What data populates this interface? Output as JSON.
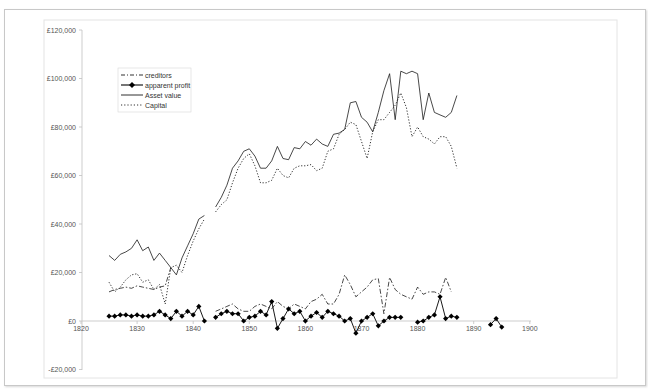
{
  "chart_data": {
    "type": "line",
    "title": "",
    "xlabel": "",
    "ylabel": "",
    "xlim": [
      1820,
      1900
    ],
    "ylim": [
      -20000,
      120000
    ],
    "x_ticks": [
      "1820",
      "1830",
      "1840",
      "1850",
      "1860",
      "1870",
      "1880",
      "1890",
      "1900"
    ],
    "y_ticks": [
      "£120,000",
      "£100,000",
      "£80,000",
      "£60,000",
      "£40,000",
      "£20,000",
      "£0",
      "-£20,000"
    ],
    "grid": false,
    "legend_position": "upper-left (inside plot)",
    "legend": [
      "creditors",
      "apparent profit",
      "Asset value",
      "Capital"
    ],
    "series": [
      {
        "name": "creditors",
        "style": "dash-dot",
        "x": [
          1825,
          1826,
          1827,
          1828,
          1829,
          1830,
          1831,
          1832,
          1833,
          1834,
          1835,
          1836,
          1844,
          1845,
          1846,
          1847,
          1848,
          1849,
          1850,
          1851,
          1852,
          1853,
          1854,
          1855,
          1856,
          1857,
          1858,
          1859,
          1860,
          1861,
          1862,
          1863,
          1864,
          1865,
          1866,
          1867,
          1868,
          1869,
          1870,
          1871,
          1872,
          1873,
          1874,
          1875,
          1876,
          1877,
          1878,
          1879,
          1880,
          1881,
          1882,
          1883,
          1884,
          1885,
          1886
        ],
        "values": [
          12000,
          13000,
          13500,
          14000,
          13500,
          14500,
          14000,
          13500,
          13000,
          14000,
          14500,
          22000,
          4000,
          5000,
          6000,
          7000,
          5000,
          4000,
          4000,
          6000,
          7000,
          6000,
          5000,
          8000,
          6000,
          5000,
          7000,
          6000,
          5000,
          8000,
          9000,
          11000,
          7000,
          7000,
          11000,
          19000,
          15000,
          10000,
          12000,
          14000,
          17000,
          17500,
          3000,
          18000,
          13000,
          11000,
          10000,
          9000,
          14000,
          11000,
          12000,
          12000,
          11000,
          18000,
          12000
        ]
      },
      {
        "name": "apparent profit",
        "style": "solid with diamond markers",
        "x": [
          1825,
          1826,
          1827,
          1828,
          1829,
          1830,
          1831,
          1832,
          1833,
          1834,
          1835,
          1836,
          1837,
          1838,
          1839,
          1840,
          1841,
          1842,
          1844,
          1845,
          1846,
          1847,
          1848,
          1849,
          1850,
          1851,
          1852,
          1853,
          1854,
          1855,
          1856,
          1857,
          1858,
          1859,
          1860,
          1861,
          1862,
          1863,
          1864,
          1865,
          1866,
          1867,
          1868,
          1869,
          1870,
          1871,
          1872,
          1873,
          1874,
          1875,
          1876,
          1877,
          1880,
          1881,
          1882,
          1883,
          1884,
          1885,
          1886,
          1887,
          1893,
          1894,
          1895
        ],
        "values": [
          2000,
          2000,
          2500,
          2500,
          2000,
          2500,
          2000,
          2000,
          2500,
          4000,
          2500,
          1000,
          4000,
          2000,
          4000,
          2500,
          6000,
          0,
          1500,
          3000,
          4000,
          3000,
          3000,
          0,
          1500,
          2000,
          4000,
          2500,
          8000,
          -3000,
          1000,
          5000,
          3000,
          4000,
          0,
          2000,
          3500,
          1500,
          4000,
          3000,
          2000,
          0,
          1000,
          -5000,
          0,
          1500,
          3000,
          -2000,
          0,
          1500,
          1500,
          1500,
          -500,
          0,
          1500,
          2500,
          10000,
          1000,
          2000,
          1500,
          -1500,
          1000,
          -2500
        ]
      },
      {
        "name": "Asset value",
        "style": "solid",
        "x": [
          1825,
          1826,
          1827,
          1828,
          1829,
          1830,
          1831,
          1832,
          1833,
          1834,
          1835,
          1836,
          1837,
          1838,
          1839,
          1840,
          1841,
          1842,
          1844,
          1845,
          1846,
          1847,
          1848,
          1849,
          1850,
          1851,
          1852,
          1853,
          1854,
          1855,
          1856,
          1857,
          1858,
          1859,
          1860,
          1861,
          1862,
          1863,
          1864,
          1865,
          1866,
          1867,
          1868,
          1869,
          1870,
          1871,
          1872,
          1873,
          1874,
          1875,
          1876,
          1877,
          1878,
          1879,
          1880,
          1881,
          1882,
          1883,
          1884,
          1885,
          1886,
          1887
        ],
        "values": [
          27000,
          25000,
          27500,
          28500,
          30000,
          33500,
          29000,
          30500,
          25000,
          28000,
          25000,
          22000,
          19000,
          26000,
          31000,
          36000,
          42000,
          43500,
          47000,
          51000,
          56000,
          63000,
          66000,
          70000,
          71000,
          68000,
          63000,
          63000,
          66000,
          72000,
          67000,
          66500,
          71500,
          71000,
          74000,
          72500,
          75000,
          73000,
          72000,
          77000,
          77500,
          79000,
          90000,
          90500,
          84000,
          82000,
          78000,
          86000,
          95000,
          102000,
          83000,
          103000,
          102000,
          103000,
          102000,
          83000,
          94000,
          86000,
          85000,
          84000,
          86000,
          93000
        ]
      },
      {
        "name": "Capital",
        "style": "dotted",
        "x": [
          1825,
          1826,
          1827,
          1828,
          1829,
          1830,
          1831,
          1832,
          1833,
          1834,
          1835,
          1836,
          1837,
          1838,
          1839,
          1840,
          1841,
          1842,
          1844,
          1845,
          1846,
          1847,
          1848,
          1849,
          1850,
          1851,
          1852,
          1853,
          1854,
          1855,
          1856,
          1857,
          1858,
          1859,
          1860,
          1861,
          1862,
          1863,
          1864,
          1865,
          1866,
          1867,
          1868,
          1869,
          1870,
          1871,
          1872,
          1873,
          1874,
          1875,
          1876,
          1877,
          1878,
          1879,
          1880,
          1881,
          1882,
          1883,
          1884,
          1885,
          1886,
          1887
        ],
        "values": [
          16000,
          12000,
          14000,
          17000,
          19000,
          19500,
          16000,
          17000,
          13000,
          15000,
          7000,
          22000,
          23000,
          20000,
          27000,
          33000,
          38000,
          42000,
          45000,
          48000,
          50000,
          57000,
          63000,
          67000,
          69000,
          64000,
          57000,
          57000,
          58000,
          63000,
          60000,
          59000,
          63000,
          64000,
          64000,
          64500,
          62000,
          63000,
          70000,
          71000,
          77000,
          79000,
          82000,
          81000,
          74000,
          67000,
          78000,
          83000,
          83000,
          86000,
          89000,
          94000,
          88000,
          76000,
          80000,
          76000,
          75000,
          73000,
          76000,
          76000,
          72000,
          63000
        ]
      }
    ]
  },
  "legend": {
    "items": [
      {
        "label": "creditors"
      },
      {
        "label": "apparent profit"
      },
      {
        "label": "Asset value"
      },
      {
        "label": "Capital"
      }
    ]
  },
  "axes": {
    "y_ticks": [
      {
        "label": "£120,000",
        "value": 120000
      },
      {
        "label": "£100,000",
        "value": 100000
      },
      {
        "label": "£80,000",
        "value": 80000
      },
      {
        "label": "£60,000",
        "value": 60000
      },
      {
        "label": "£40,000",
        "value": 40000
      },
      {
        "label": "£20,000",
        "value": 20000
      },
      {
        "label": "£0",
        "value": 0
      },
      {
        "label": "-£20,000",
        "value": -20000
      }
    ],
    "x_ticks": [
      {
        "label": "1820",
        "value": 1820
      },
      {
        "label": "1830",
        "value": 1830
      },
      {
        "label": "1840",
        "value": 1840
      },
      {
        "label": "1850",
        "value": 1850
      },
      {
        "label": "1860",
        "value": 1860
      },
      {
        "label": "1870",
        "value": 1870
      },
      {
        "label": "1880",
        "value": 1880
      },
      {
        "label": "1890",
        "value": 1890
      },
      {
        "label": "1900",
        "value": 1900
      }
    ]
  },
  "colors": {
    "lines": "#1a1a1a",
    "axis": "#c0c0c0",
    "frame": "#d0d0d0",
    "text": "#555555"
  }
}
